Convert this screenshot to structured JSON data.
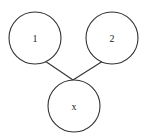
{
  "diagram": {
    "type": "tree",
    "nodes": [
      {
        "id": "n1",
        "label": "1",
        "cx": 35,
        "cy": 38,
        "r": 26
      },
      {
        "id": "n2",
        "label": "2",
        "cx": 112,
        "cy": 38,
        "r": 26
      },
      {
        "id": "nx",
        "label": "x",
        "cx": 74,
        "cy": 106,
        "r": 26
      }
    ],
    "edges": [
      {
        "from": "n1",
        "to": "nx",
        "x1": 45,
        "y1": 61,
        "x2": 73,
        "y2": 80
      },
      {
        "from": "n2",
        "to": "nx",
        "x1": 103,
        "y1": 61,
        "x2": 73,
        "y2": 80
      }
    ],
    "colors": {
      "stroke": "#333333",
      "fill": "#ffffff",
      "text": "#222222"
    }
  }
}
